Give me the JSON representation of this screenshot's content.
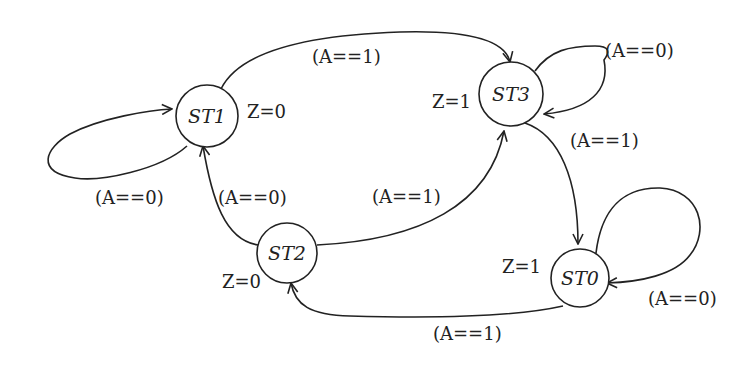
{
  "diagram": {
    "type": "state-machine",
    "colors": {
      "stroke": "#222222",
      "background": "#ffffff"
    },
    "states": [
      {
        "id": "ST1",
        "label": "ST1",
        "output": "Z=0"
      },
      {
        "id": "ST3",
        "label": "ST3",
        "output": "Z=1"
      },
      {
        "id": "ST2",
        "label": "ST2",
        "output": "Z=0"
      },
      {
        "id": "ST0",
        "label": "ST0",
        "output": "Z=1"
      }
    ],
    "transitions": [
      {
        "from": "ST1",
        "to": "ST1",
        "condition": "(A==0)"
      },
      {
        "from": "ST1",
        "to": "ST3",
        "condition": "(A==1)"
      },
      {
        "from": "ST3",
        "to": "ST3",
        "condition": "(A==0)"
      },
      {
        "from": "ST3",
        "to": "ST0",
        "condition": "(A==1)"
      },
      {
        "from": "ST2",
        "to": "ST1",
        "condition": "(A==0)"
      },
      {
        "from": "ST2",
        "to": "ST3",
        "condition": "(A==1)"
      },
      {
        "from": "ST0",
        "to": "ST0",
        "condition": "(A==0)"
      },
      {
        "from": "ST0",
        "to": "ST2",
        "condition": "(A==1)"
      }
    ]
  }
}
